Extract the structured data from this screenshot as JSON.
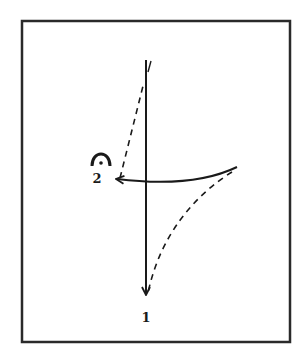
{
  "diagram": {
    "type": "conducting-beat-pattern",
    "beats": [
      {
        "number": "1",
        "label": "1",
        "direction": "down"
      },
      {
        "number": "2",
        "label": "2",
        "direction": "left",
        "marking": "fermata"
      }
    ],
    "colors": {
      "ink": "#1a1a1a",
      "background": "#ffffff",
      "frame": "#2a2a2a"
    }
  }
}
